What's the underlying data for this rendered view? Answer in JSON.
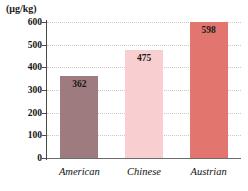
{
  "chart_data": {
    "type": "bar",
    "title": "",
    "subtitle": "",
    "unit_label": "(μg/kg)",
    "categories": [
      "American",
      "Chinese",
      "Austrian"
    ],
    "values": [
      362,
      475,
      598
    ],
    "value_labels": [
      "362",
      "475",
      "598"
    ],
    "series": [
      {
        "name": "",
        "values": [
          362,
          475,
          598
        ]
      }
    ],
    "xlabel": "",
    "ylabel": "(μg/kg)",
    "ylim": [
      0,
      600
    ],
    "ytick_values": [
      600,
      500,
      400,
      300,
      200,
      100,
      0
    ],
    "ytick_labels": [
      "600",
      "500",
      "400",
      "300",
      "200",
      "100",
      "0"
    ],
    "ystep": 100,
    "grid": true,
    "grid_style": "dotted",
    "legend": false,
    "legend_position": "none",
    "bar_colors": [
      "#9d7b7e",
      "#f8ced1",
      "#e2756e"
    ],
    "axis_color": "#4a4a4a",
    "grid_color": "#cfc6c6",
    "label_color": "#141414",
    "background": "#ffffff"
  }
}
